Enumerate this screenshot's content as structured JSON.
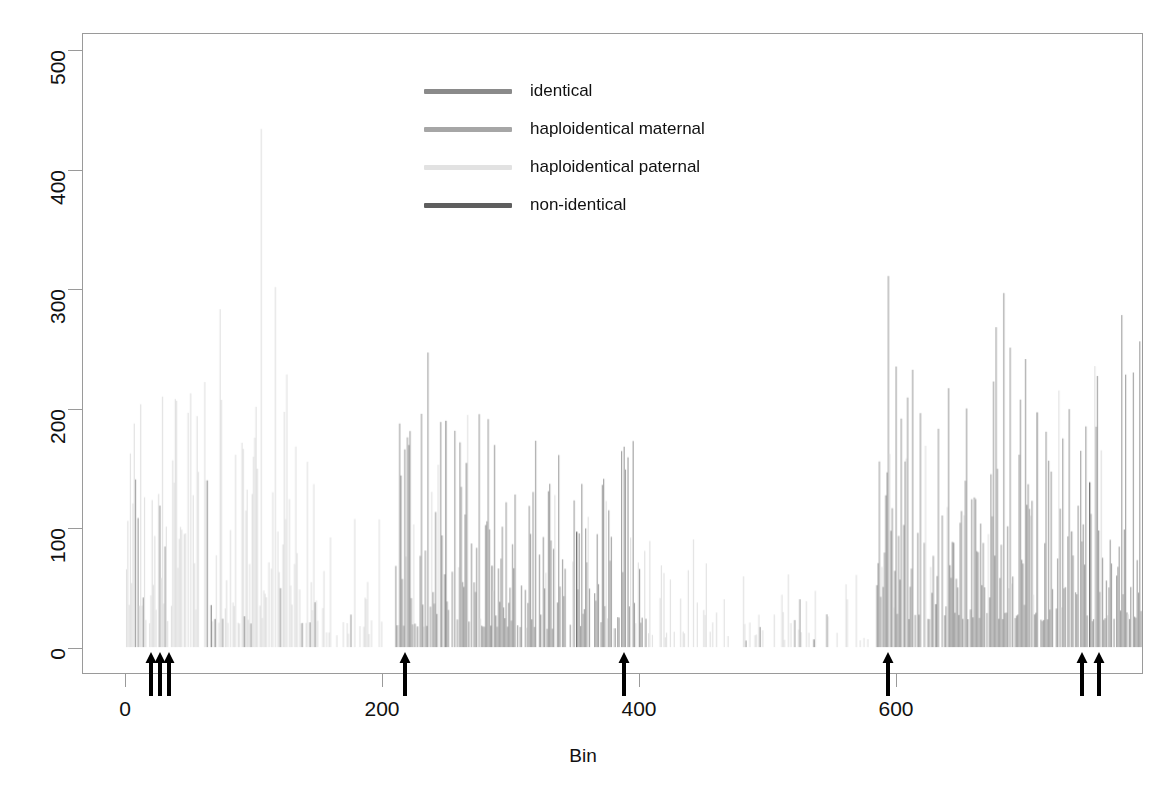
{
  "chart_data": {
    "type": "bar",
    "title": "",
    "subtitle": "",
    "xlabel": "Bin",
    "ylabel": "",
    "xlim": [
      0,
      793
    ],
    "ylim": [
      0,
      510
    ],
    "xticks": [
      0,
      200,
      400,
      600
    ],
    "yticks": [
      0,
      100,
      200,
      300,
      400,
      500
    ],
    "grid": false,
    "legend_position": "top-center",
    "bar_width_px": 1.2,
    "legend": [
      {
        "label": "identical",
        "color": "#8a8a8a",
        "key": "identical"
      },
      {
        "label": "haploidentical maternal",
        "color": "#a6a6a6",
        "key": "maternal"
      },
      {
        "label": "haploidentical paternal",
        "color": "#e2e2e2",
        "key": "paternal"
      },
      {
        "label": "non-identical",
        "color": "#5e5e5e",
        "key": "nonidentical"
      }
    ],
    "annotations": {
      "arrows": [
        {
          "bin": 20,
          "label": "arrow-marker-1"
        },
        {
          "bin": 27,
          "label": "arrow-marker-2"
        },
        {
          "bin": 34,
          "label": "arrow-marker-3"
        },
        {
          "bin": 218,
          "label": "arrow-marker-4"
        },
        {
          "bin": 388,
          "label": "arrow-marker-5"
        },
        {
          "bin": 594,
          "label": "arrow-marker-6"
        },
        {
          "bin": 745,
          "label": "arrow-marker-7"
        },
        {
          "bin": 758,
          "label": "arrow-marker-8"
        }
      ]
    },
    "regions": [
      {
        "from": 0,
        "to": 150,
        "dominant": "paternal",
        "density": 0.8,
        "mean": 110,
        "peak": 500
      },
      {
        "from": 150,
        "to": 200,
        "dominant": "paternal",
        "density": 0.4,
        "mean": 55,
        "peak": 180
      },
      {
        "from": 200,
        "to": 210,
        "dominant": "none",
        "density": 0.02,
        "mean": 5,
        "peak": 20
      },
      {
        "from": 210,
        "to": 300,
        "dominant": "maternal",
        "density": 0.85,
        "mean": 95,
        "peak": 280
      },
      {
        "from": 300,
        "to": 400,
        "dominant": "maternal",
        "density": 0.8,
        "mean": 85,
        "peak": 345
      },
      {
        "from": 400,
        "to": 470,
        "dominant": "paternal",
        "density": 0.35,
        "mean": 45,
        "peak": 240
      },
      {
        "from": 470,
        "to": 585,
        "dominant": "paternal",
        "density": 0.22,
        "mean": 30,
        "peak": 180
      },
      {
        "from": 585,
        "to": 700,
        "dominant": "maternal",
        "density": 0.9,
        "mean": 130,
        "peak": 390
      },
      {
        "from": 700,
        "to": 793,
        "dominant": "maternal",
        "density": 0.85,
        "mean": 120,
        "peak": 375
      }
    ]
  },
  "axis": {
    "x_title": "Bin",
    "x_ticklabels": [
      "0",
      "200",
      "400",
      "600"
    ],
    "y_ticklabels": [
      "0",
      "100",
      "200",
      "300",
      "400",
      "500"
    ]
  },
  "legend": {
    "items": [
      {
        "label": "identical"
      },
      {
        "label": "haploidentical maternal"
      },
      {
        "label": "haploidentical paternal"
      },
      {
        "label": "non-identical"
      }
    ]
  }
}
